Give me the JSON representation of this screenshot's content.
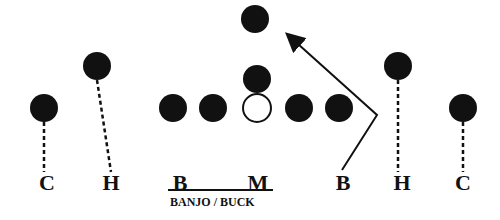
{
  "diagram": {
    "title": "BANJO / BUCK",
    "colors": {
      "player_fill": "#111111",
      "line": "#111111",
      "center_fill": "#ffffff"
    },
    "players": [
      {
        "id": "safety",
        "x": 255,
        "y": 19,
        "filled": true
      },
      {
        "id": "qb",
        "x": 257,
        "y": 79,
        "filled": true
      },
      {
        "id": "lt",
        "x": 173,
        "y": 108,
        "filled": true
      },
      {
        "id": "lg",
        "x": 213,
        "y": 108,
        "filled": true
      },
      {
        "id": "center",
        "x": 257,
        "y": 108,
        "filled": false
      },
      {
        "id": "rg",
        "x": 299,
        "y": 108,
        "filled": true
      },
      {
        "id": "rt",
        "x": 339,
        "y": 108,
        "filled": true
      },
      {
        "id": "left-c",
        "x": 44,
        "y": 108,
        "filled": true
      },
      {
        "id": "left-h",
        "x": 97,
        "y": 66,
        "filled": true
      },
      {
        "id": "right-h",
        "x": 398,
        "y": 66,
        "filled": true
      },
      {
        "id": "right-c",
        "x": 463,
        "y": 108,
        "filled": true
      }
    ],
    "labels": [
      {
        "text": "C",
        "x": 47,
        "y": 172
      },
      {
        "text": "H",
        "x": 111,
        "y": 172
      },
      {
        "text": "B",
        "x": 180,
        "y": 172
      },
      {
        "text": "M",
        "x": 258,
        "y": 172
      },
      {
        "text": "B",
        "x": 343,
        "y": 172
      },
      {
        "text": "H",
        "x": 402,
        "y": 172
      },
      {
        "text": "C",
        "x": 463,
        "y": 172
      }
    ],
    "caption": "BANJO / BUCK"
  }
}
